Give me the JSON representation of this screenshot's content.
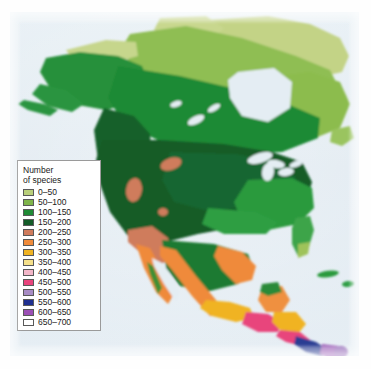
{
  "figure": {
    "kind": "choropleth-map",
    "region": "North America",
    "ocean_color": "#e4edf3",
    "page_background": "#ffffff"
  },
  "legend": {
    "title": "Number\nof species",
    "title_line1": "Number",
    "title_line2": "of species",
    "entries": [
      {
        "label": "0–50",
        "color": "#b9cf7a",
        "min": 0,
        "max": 50
      },
      {
        "label": "50–100",
        "color": "#7fb44a",
        "min": 50,
        "max": 100
      },
      {
        "label": "100–150",
        "color": "#1f8a35",
        "min": 100,
        "max": 150
      },
      {
        "label": "150–200",
        "color": "#145c28",
        "min": 150,
        "max": 200
      },
      {
        "label": "200–250",
        "color": "#cf7b5c",
        "min": 200,
        "max": 250
      },
      {
        "label": "250–300",
        "color": "#f08b3a",
        "min": 250,
        "max": 300
      },
      {
        "label": "300–350",
        "color": "#f0b323",
        "min": 300,
        "max": 350
      },
      {
        "label": "350–400",
        "color": "#f5e08a",
        "min": 350,
        "max": 400
      },
      {
        "label": "400–450",
        "color": "#f2b6c8",
        "min": 400,
        "max": 450
      },
      {
        "label": "450–500",
        "color": "#e8447c",
        "min": 450,
        "max": 500
      },
      {
        "label": "500–550",
        "color": "#a88cc4",
        "min": 500,
        "max": 550
      },
      {
        "label": "550–600",
        "color": "#1f2f8f",
        "min": 550,
        "max": 600
      },
      {
        "label": "600–650",
        "color": "#9b4fb5",
        "min": 600,
        "max": 650
      },
      {
        "label": "650–700",
        "color": "#ffffff",
        "min": 650,
        "max": 700
      }
    ]
  },
  "map_regions": [
    {
      "name": "alaska-interior",
      "class": "100–150"
    },
    {
      "name": "alaska-north-slope",
      "class": "0–50"
    },
    {
      "name": "yukon-nwt",
      "class": "50–100"
    },
    {
      "name": "canadian-arctic",
      "class": "0–50"
    },
    {
      "name": "hudson-bay-lowlands",
      "class": "50–100"
    },
    {
      "name": "labrador-quebec",
      "class": "50–100"
    },
    {
      "name": "boreal-canada",
      "class": "100–150"
    },
    {
      "name": "pacific-northwest",
      "class": "150–200"
    },
    {
      "name": "rocky-mountains",
      "class": "200–250"
    },
    {
      "name": "great-basin",
      "class": "200–250"
    },
    {
      "name": "great-plains",
      "class": "150–200"
    },
    {
      "name": "southeast-usa",
      "class": "100–150"
    },
    {
      "name": "florida-peninsula",
      "class": "50–100"
    },
    {
      "name": "baja-california",
      "class": "250–300"
    },
    {
      "name": "mexico-west-coast",
      "class": "250–300"
    },
    {
      "name": "mexico-sierra-madre",
      "class": "300–350"
    },
    {
      "name": "southern-mexico",
      "class": "400–450"
    },
    {
      "name": "guatemala-honduras",
      "class": "450–500"
    },
    {
      "name": "nicaragua-costa-rica",
      "class": "300–350"
    },
    {
      "name": "panama",
      "class": "550–600"
    },
    {
      "name": "nw-colombia",
      "class": "600–650"
    }
  ]
}
